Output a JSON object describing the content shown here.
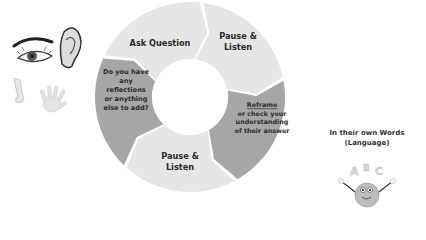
{
  "diagram": {
    "type": "cycle",
    "segments": [
      {
        "id": "ask",
        "lines": [
          "Ask Question"
        ],
        "fill": "#e6e6e6"
      },
      {
        "id": "pause1",
        "lines": [
          "Pause &",
          "Listen"
        ],
        "fill": "#e6e6e6"
      },
      {
        "id": "reframe",
        "title": "Reframe",
        "lines": [
          "or check your",
          "understanding",
          "of their answer"
        ],
        "fill": "#a6a6a6"
      },
      {
        "id": "pause2",
        "lines": [
          "Pause &",
          "Listen"
        ],
        "fill": "#e6e6e6"
      },
      {
        "id": "reflect",
        "lines": [
          "Do you have",
          "any",
          "reflections",
          "or anything",
          "else to add?"
        ],
        "fill": "#a6a6a6"
      }
    ]
  },
  "senses_icons": [
    "eye-icon",
    "ear-icon",
    "nose-icon",
    "hand-icon"
  ],
  "side_panel": {
    "title_line1": "In their own Words",
    "title_line2": "(Language)",
    "letters": [
      "A",
      "B",
      "C"
    ]
  },
  "colors": {
    "light_segment": "#e6e6e6",
    "dark_segment": "#a6a6a6",
    "text": "#2b2b2b"
  }
}
